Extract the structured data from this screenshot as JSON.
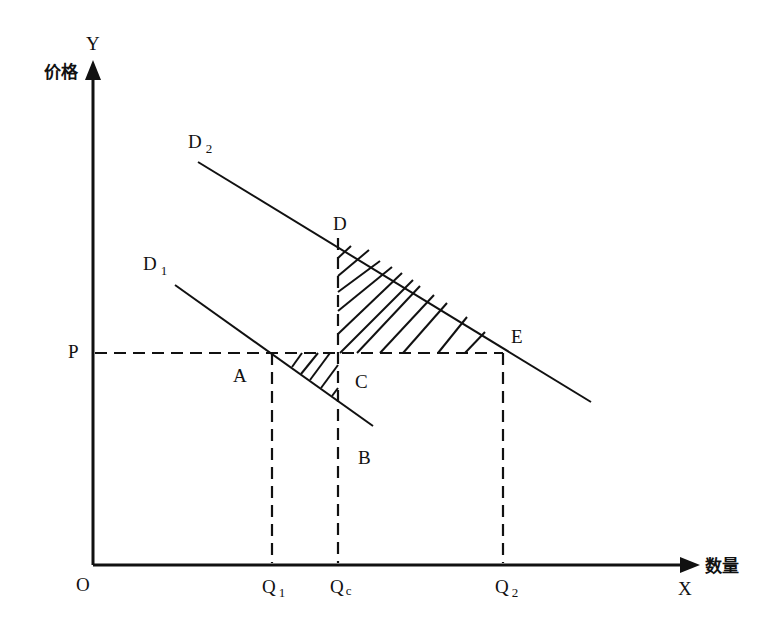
{
  "diagram": {
    "title": "",
    "y_axis": {
      "letter": "Y",
      "label": "价格"
    },
    "x_axis": {
      "letter": "X",
      "label": "数量"
    },
    "origin": "O",
    "price_level": "P",
    "curves": [
      {
        "name": "D",
        "subscript": "2",
        "description": "higher demand curve"
      },
      {
        "name": "D",
        "subscript": "1",
        "description": "lower demand curve"
      }
    ],
    "points": {
      "A": "A",
      "B": "B",
      "C": "C",
      "D": "D",
      "E": "E"
    },
    "quantities": [
      {
        "name": "Q",
        "subscript": "1"
      },
      {
        "name": "Q",
        "subscript": "c"
      },
      {
        "name": "Q",
        "subscript": "2"
      }
    ],
    "shaded_regions": [
      "triangle A-C-B (below P, between D1 and Qc)",
      "triangle C-D-E (above P, below D2)"
    ]
  }
}
